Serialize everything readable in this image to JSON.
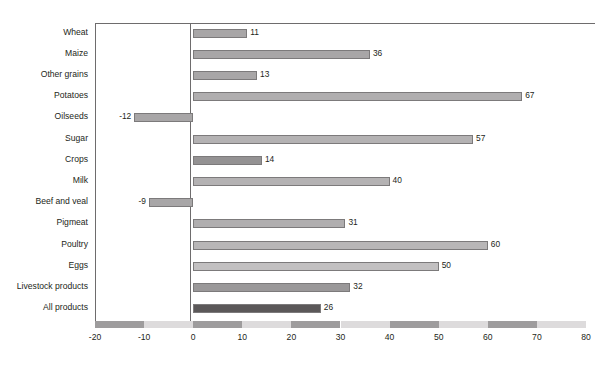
{
  "title_remnant": "",
  "chart_data": {
    "type": "bar",
    "orientation": "horizontal",
    "title": "",
    "xlabel": "",
    "ylabel": "",
    "xlim": [
      -20,
      80
    ],
    "xticks": [
      "-20",
      "-10",
      "0",
      "10",
      "20",
      "30",
      "40",
      "50",
      "60",
      "70",
      "80"
    ],
    "grid": false,
    "legend": "none",
    "categories": [
      "Wheat",
      "Maize",
      "Other grains",
      "Potatoes",
      "Oilseeds",
      "Sugar",
      "Crops",
      "Milk",
      "Beef and veal",
      "Pigmeat",
      "Poultry",
      "Eggs",
      "Livestock products",
      "All products"
    ],
    "values": [
      11,
      36,
      13,
      67,
      -12,
      57,
      14,
      40,
      -9,
      31,
      60,
      50,
      32,
      26
    ],
    "value_labels": [
      "11",
      "36",
      "13",
      "67",
      "-12",
      "57",
      "14",
      "40",
      "-9",
      "31",
      "60",
      "50",
      "32",
      "26"
    ],
    "bar_colors": [
      "#a8a6a7",
      "#a8a6a7",
      "#a8a6a7",
      "#b0aeaf",
      "#a8a6a7",
      "#b4b2b3",
      "#949293",
      "#b4b2b3",
      "#a8a6a7",
      "#b0aeaf",
      "#b8b6b7",
      "#c2c0c1",
      "#9a9899",
      "#5b5859"
    ],
    "axis_strip_colors": [
      "#9e9c9d",
      "#dddbdc"
    ],
    "axis_strip_intervals": [
      "-20 to -10",
      "-10 to 0",
      "0 to 10",
      "10 to 20",
      "20 to 30",
      "30 to 40",
      "40 to 50",
      "50 to 60",
      "60 to 70",
      "70 to 80"
    ],
    "frame_color": "#6e6c6d"
  }
}
